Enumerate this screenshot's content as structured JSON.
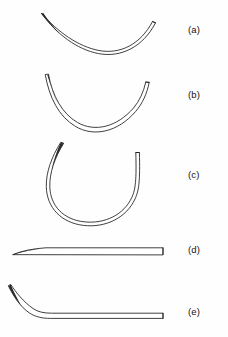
{
  "figure": {
    "background_color": "#fefefe",
    "ink_color": "#1d1d1d",
    "width": 228,
    "height": 337,
    "rows": [
      {
        "id": "a",
        "label": "(a)",
        "label_x": 188,
        "label_y": 30,
        "description": "shallow curved needle, approximately quarter-circle arc, sharp tapered left point, flat blunt right end",
        "curvature": "1/4 circle",
        "tip": "sharp-point",
        "end": "flat-swage"
      },
      {
        "id": "b",
        "label": "(b)",
        "label_x": 188,
        "label_y": 95,
        "description": "medium curved needle, approximately three-eighths circle arc, sharp tapered left point, flat blunt right end",
        "curvature": "3/8 circle",
        "tip": "sharp-point",
        "end": "flat-swage"
      },
      {
        "id": "c",
        "label": "(c)",
        "label_x": 188,
        "label_y": 175,
        "description": "deep curved needle, approximately half circle arc forming a U, sharp tapered left point, flat blunt right end",
        "curvature": "1/2 circle",
        "tip": "sharp-point",
        "end": "flat-swage"
      },
      {
        "id": "d",
        "label": "(d)",
        "label_x": 188,
        "label_y": 250,
        "description": "straight needle, slight taper at left point, flat blunt right end",
        "curvature": "straight",
        "tip": "sharp-point",
        "end": "flat-swage"
      },
      {
        "id": "e",
        "label": "(e)",
        "label_x": 188,
        "label_y": 312,
        "description": "straight needle with curved left end, ski or half-curved shape, sharp tapered left point, flat blunt right end",
        "curvature": "half-curved (ski)",
        "tip": "sharp-point",
        "end": "flat-swage"
      }
    ]
  }
}
